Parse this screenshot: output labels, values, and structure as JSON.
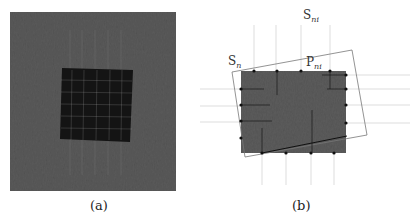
{
  "figure": {
    "panels": [
      {
        "id": "a",
        "caption": "(a)",
        "description": "Textured gray background image with a dark square region overlaid by a faint grid",
        "colors": {
          "background": "#5a5a5a",
          "square": "#141414",
          "grid": "#9a9a9a"
        }
      },
      {
        "id": "b",
        "caption": "(b)",
        "description": "Gray rectangle with sample points; rotated rectangle outline and extended grid lines",
        "labels": {
          "s_n": {
            "base": "S",
            "sub": "n"
          },
          "s_ni": {
            "base": "S",
            "sub": "ni"
          },
          "p_ni": {
            "base": "P",
            "sub": "ni"
          }
        },
        "colors": {
          "rect": "#5c5c5c",
          "outline": "#777777",
          "points": "#111111",
          "grid": "#cfcfcf"
        }
      }
    ]
  }
}
